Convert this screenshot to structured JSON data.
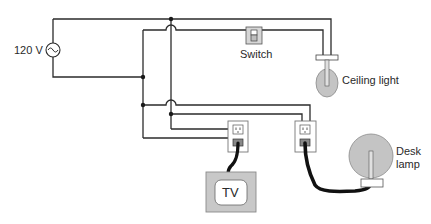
{
  "diagram": {
    "type": "household parallel wiring circuit",
    "source": {
      "label": "120 V",
      "symbol": "ac-source-icon"
    },
    "switch": {
      "label": "Switch"
    },
    "ceiling_light": {
      "label": "Ceiling light"
    },
    "tv": {
      "label": "TV"
    },
    "desk_lamp": {
      "label_line1": "Desk",
      "label_line2": "lamp"
    },
    "outlets": [
      {
        "id": "outlet-tv",
        "connected_to": "TV"
      },
      {
        "id": "outlet-lamp",
        "connected_to": "Desk lamp"
      }
    ],
    "colors": {
      "wire": "#2b2b2b",
      "cord": "#111111",
      "fixture_fill": "#c4c4c4",
      "outlet_plate": "#ffffff",
      "tv_frame": "#c8c8c8"
    }
  }
}
